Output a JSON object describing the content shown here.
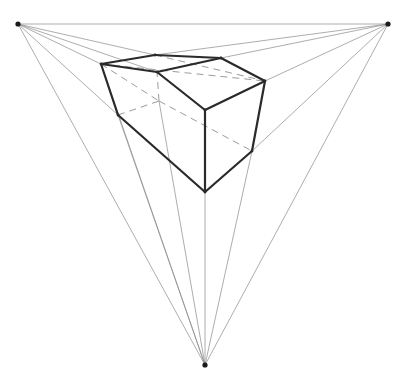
{
  "diagram": {
    "title": "",
    "type": "three-point perspective construction",
    "colors": {
      "background": "#ffffff",
      "edge": "#2a2a2a",
      "guide": "#8a8a8a",
      "hidden": "#9c9c9c",
      "vanishing_point": "#1a1a1a"
    },
    "vanishing_points": {
      "left": [
        18,
        24
      ],
      "right": [
        388,
        24
      ],
      "bottom": [
        205,
        365
      ]
    },
    "vertices": {
      "top_left": [
        101,
        64
      ],
      "top_back": [
        155,
        55
      ],
      "top_right_back": [
        221,
        58
      ],
      "right_top": [
        265,
        81
      ],
      "ridge_front": [
        157,
        72
      ],
      "front_top": [
        205,
        110
      ],
      "left_bottom": [
        118,
        115
      ],
      "front_bottom": [
        205,
        192
      ],
      "right_bottom": [
        252,
        151
      ],
      "hidden_back": [
        159,
        101
      ]
    },
    "visible_edges": [
      [
        "top_left",
        "top_back"
      ],
      [
        "top_back",
        "top_right_back"
      ],
      [
        "top_right_back",
        "right_top"
      ],
      [
        "top_left",
        "ridge_front"
      ],
      [
        "ridge_front",
        "top_right_back"
      ],
      [
        "ridge_front",
        "front_top"
      ],
      [
        "front_top",
        "right_top"
      ],
      [
        "top_left",
        "left_bottom"
      ],
      [
        "left_bottom",
        "front_bottom"
      ],
      [
        "front_top",
        "front_bottom"
      ],
      [
        "front_bottom",
        "right_bottom"
      ],
      [
        "right_bottom",
        "right_top"
      ]
    ],
    "hidden_edges": [
      [
        "left_bottom",
        "hidden_back"
      ],
      [
        "hidden_back",
        "right_bottom"
      ],
      [
        "hidden_back",
        "ridge_front"
      ],
      [
        "top_left",
        "right_top"
      ],
      [
        "top_back",
        "right_top"
      ],
      [
        "top_left",
        "hidden_back"
      ]
    ],
    "construction_lines": [
      [
        "left",
        "right"
      ],
      [
        "left",
        "top_back"
      ],
      [
        "left",
        "top_left"
      ],
      [
        "left",
        "ridge_front"
      ],
      [
        "left",
        "left_bottom"
      ],
      [
        "left",
        "bottom"
      ],
      [
        "right",
        "top_right_back"
      ],
      [
        "right",
        "right_top"
      ],
      [
        "right",
        "top_back"
      ],
      [
        "right",
        "right_bottom"
      ],
      [
        "right",
        "bottom"
      ],
      [
        "bottom",
        "left_bottom"
      ],
      [
        "bottom",
        "hidden_back"
      ],
      [
        "bottom",
        "front_bottom"
      ],
      [
        "bottom",
        "right_bottom"
      ],
      [
        "bottom",
        "top_left"
      ]
    ]
  }
}
